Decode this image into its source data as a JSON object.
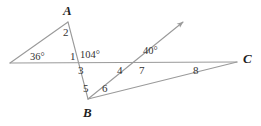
{
  "figure": {
    "type": "geometry-diagram",
    "stroke_color": "#9a9a9a",
    "text_color": "#2b2b2b",
    "background": "#ffffff"
  },
  "points": [
    {
      "id": "A",
      "label": "A",
      "x": 68,
      "y": 22,
      "label_x": 63,
      "label_y": 4
    },
    {
      "id": "B",
      "label": "B",
      "x": 88,
      "y": 99,
      "label_x": 83,
      "label_y": 106
    },
    {
      "id": "C",
      "label": "C",
      "x": 237,
      "y": 62,
      "label_x": 243,
      "label_y": 52
    }
  ],
  "angle_measures": [
    {
      "id": "m36",
      "text": "36°",
      "x": 30,
      "y": 52
    },
    {
      "id": "m104",
      "text": "104°",
      "x": 80,
      "y": 50
    },
    {
      "id": "m40",
      "text": "40°",
      "x": 143,
      "y": 46
    }
  ],
  "angle_numbers": [
    {
      "id": "n1",
      "text": "1",
      "x": 70,
      "y": 51
    },
    {
      "id": "n2",
      "text": "2",
      "x": 63,
      "y": 27
    },
    {
      "id": "n3",
      "text": "3",
      "x": 78,
      "y": 65
    },
    {
      "id": "n4",
      "text": "4",
      "x": 117,
      "y": 65
    },
    {
      "id": "n5",
      "text": "5",
      "x": 83,
      "y": 83
    },
    {
      "id": "n6",
      "text": "6",
      "x": 102,
      "y": 83
    },
    {
      "id": "n7",
      "text": "7",
      "x": 139,
      "y": 65
    },
    {
      "id": "n8",
      "text": "8",
      "x": 193,
      "y": 65
    }
  ],
  "segments": [
    {
      "id": "horizontal-line",
      "from": [
        10,
        63
      ],
      "to": [
        237,
        62
      ],
      "arrow": false
    },
    {
      "id": "left-ray-to-A",
      "from": [
        10,
        63
      ],
      "to": [
        68,
        22
      ],
      "arrow": false
    },
    {
      "id": "A-to-B",
      "from": [
        68,
        22
      ],
      "to": [
        88,
        99
      ],
      "arrow": false
    },
    {
      "id": "B-to-C",
      "from": [
        88,
        99
      ],
      "to": [
        237,
        62
      ],
      "arrow": false
    },
    {
      "id": "B-ray-upper-right",
      "from": [
        88,
        99
      ],
      "to": [
        185,
        20
      ],
      "arrow": true
    }
  ]
}
